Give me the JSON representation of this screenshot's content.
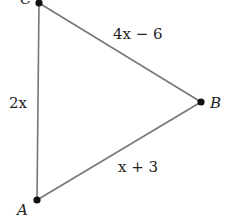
{
  "diagram": {
    "type": "triangle",
    "vertices": {
      "A": {
        "label": "A",
        "x": 37,
        "y": 200
      },
      "B": {
        "label": "B",
        "x": 201,
        "y": 102
      },
      "C": {
        "label": "C",
        "x": 39,
        "y": 3
      }
    },
    "sides": {
      "AC": {
        "label": "2x"
      },
      "CB": {
        "label": "4x − 6"
      },
      "AB": {
        "label": "x + 3"
      }
    },
    "colors": {
      "line": "#777777",
      "point": "#111111",
      "text": "#222222"
    }
  }
}
